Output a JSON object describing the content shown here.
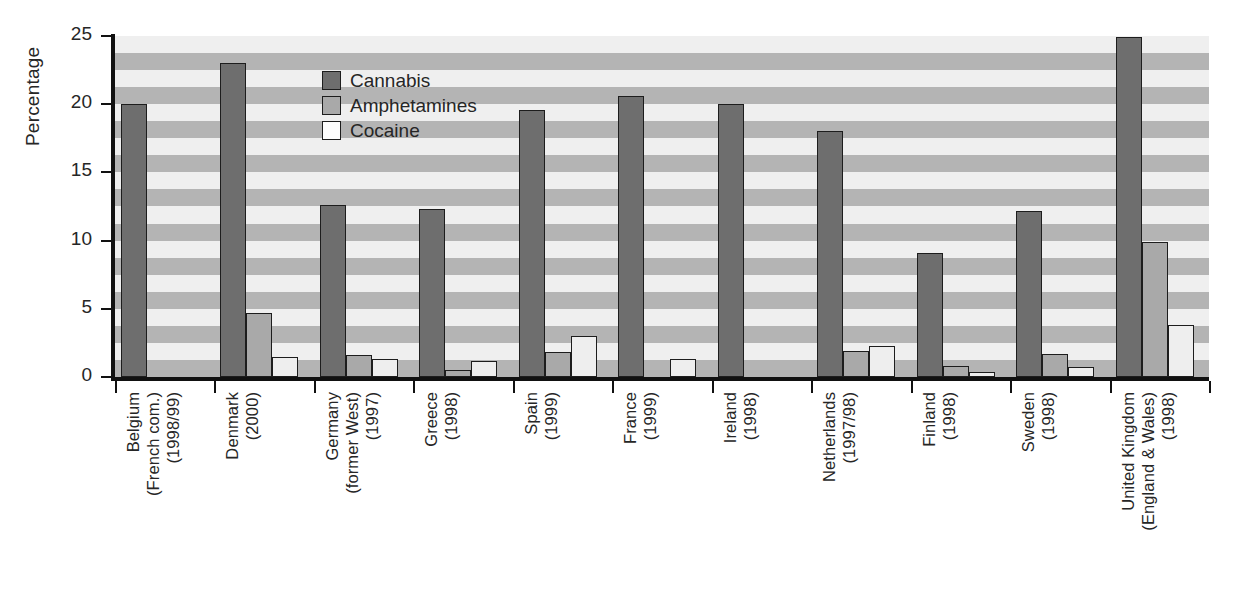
{
  "chart_data": {
    "type": "bar",
    "title": "",
    "subtitle": "",
    "xlabel": "",
    "ylabel": "Percentage",
    "ylim": [
      0,
      25
    ],
    "yticks": [
      0,
      5,
      10,
      15,
      20,
      25
    ],
    "ytick_labels": [
      "0",
      "5",
      "10",
      "15",
      "20",
      "25"
    ],
    "grid": "horizontal alternating shaded bands",
    "legend_position": "inside top-left of plot area",
    "categories": [
      "Belgium\n(French com.)\n(1998/99)",
      "Denmark\n(2000)",
      "Germany\n(former West)\n(1997)",
      "Greece\n(1998)",
      "Spain\n(1999)",
      "France\n(1999)",
      "Ireland\n(1998)",
      "Netherlands\n(1997/98)",
      "Finland\n(1998)",
      "Sweden\n(1998)",
      "United Kingdom\n(England & Wales)\n(1998)"
    ],
    "series": [
      {
        "name": "Cannabis",
        "color": "#6e6e6e",
        "values": [
          20.0,
          23.0,
          12.6,
          12.3,
          19.6,
          20.6,
          20.0,
          18.0,
          9.1,
          12.2,
          24.9
        ]
      },
      {
        "name": "Amphetamines",
        "color": "#a9a9a9",
        "values": [
          null,
          4.7,
          1.6,
          0.5,
          1.8,
          null,
          null,
          1.9,
          0.8,
          1.7,
          9.9
        ]
      },
      {
        "name": "Cocaine",
        "color": "#eeeeee",
        "values": [
          null,
          1.5,
          1.3,
          1.2,
          3.0,
          1.3,
          null,
          2.3,
          0.4,
          0.7,
          3.8
        ]
      }
    ]
  },
  "axis": {
    "y_title": "Percentage"
  },
  "categories_display": [
    {
      "lines": [
        "Belgium",
        "(French com.)",
        "(1998/99)"
      ]
    },
    {
      "lines": [
        "Denmark",
        "(2000)"
      ]
    },
    {
      "lines": [
        "Germany",
        "(former West)",
        "(1997)"
      ]
    },
    {
      "lines": [
        "Greece",
        "(1998)"
      ]
    },
    {
      "lines": [
        "Spain",
        "(1999)"
      ]
    },
    {
      "lines": [
        "France",
        "(1999)"
      ]
    },
    {
      "lines": [
        "Ireland",
        "(1998)"
      ]
    },
    {
      "lines": [
        "Netherlands",
        "(1997/98)"
      ]
    },
    {
      "lines": [
        "Finland",
        "(1998)"
      ]
    },
    {
      "lines": [
        "Sweden",
        "(1998)"
      ]
    },
    {
      "lines": [
        "United Kingdom",
        "(England & Wales)",
        "(1998)"
      ]
    }
  ],
  "legend": {
    "items": [
      {
        "label": "Cannabis",
        "swatch": "cannabis"
      },
      {
        "label": "Amphetamines",
        "swatch": "amphetamines"
      },
      {
        "label": "Cocaine",
        "swatch": "cocaine"
      }
    ]
  }
}
